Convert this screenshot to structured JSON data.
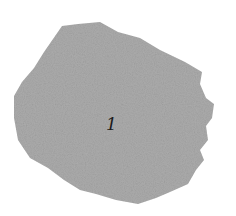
{
  "figure": {
    "label": "1",
    "fill_color": "#a9a9a9",
    "background": "#ffffff"
  }
}
